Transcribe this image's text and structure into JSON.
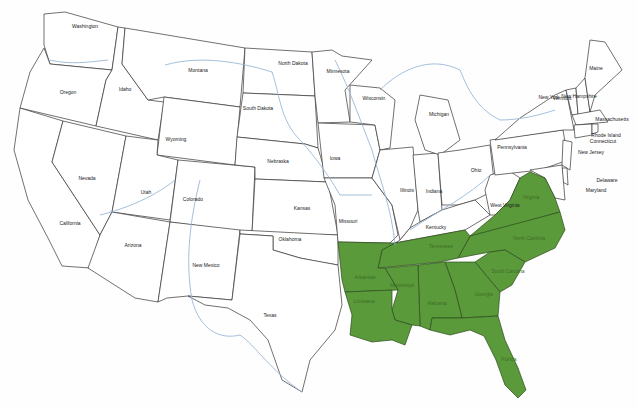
{
  "map": {
    "title": "United States state outline map",
    "highlight_color": "#5a9a3a",
    "outline_color": "#333333",
    "river_color": "#9ab8d8",
    "highlighted_states": [
      "Virginia",
      "North Carolina",
      "South Carolina",
      "Georgia",
      "Florida",
      "Alabama",
      "Mississippi",
      "Tennessee",
      "Arkansas",
      "Louisiana"
    ],
    "labels": [
      {
        "name": "Washington",
        "x": 85,
        "y": 26
      },
      {
        "name": "Oregon",
        "x": 68,
        "y": 92
      },
      {
        "name": "California",
        "x": 70,
        "y": 223
      },
      {
        "name": "Nevada",
        "x": 87,
        "y": 178
      },
      {
        "name": "Idaho",
        "x": 125,
        "y": 89
      },
      {
        "name": "Montana",
        "x": 198,
        "y": 70
      },
      {
        "name": "Wyoming",
        "x": 176,
        "y": 139
      },
      {
        "name": "Utah",
        "x": 146,
        "y": 192
      },
      {
        "name": "Colorado",
        "x": 193,
        "y": 199
      },
      {
        "name": "Arizona",
        "x": 133,
        "y": 245
      },
      {
        "name": "New Mexico",
        "x": 206,
        "y": 265
      },
      {
        "name": "North Dakota",
        "x": 293,
        "y": 63
      },
      {
        "name": "South Dakota",
        "x": 258,
        "y": 108
      },
      {
        "name": "Nebraska",
        "x": 278,
        "y": 161
      },
      {
        "name": "Kansas",
        "x": 302,
        "y": 208
      },
      {
        "name": "Oklahoma",
        "x": 290,
        "y": 239
      },
      {
        "name": "Texas",
        "x": 270,
        "y": 315
      },
      {
        "name": "Minnesota",
        "x": 338,
        "y": 71
      },
      {
        "name": "Iowa",
        "x": 335,
        "y": 158
      },
      {
        "name": "Missouri",
        "x": 348,
        "y": 221
      },
      {
        "name": "Wisconsin",
        "x": 374,
        "y": 98
      },
      {
        "name": "Illinois",
        "x": 407,
        "y": 190
      },
      {
        "name": "Michigan",
        "x": 439,
        "y": 114
      },
      {
        "name": "Indiana",
        "x": 434,
        "y": 191
      },
      {
        "name": "Ohio",
        "x": 476,
        "y": 170
      },
      {
        "name": "Kentucky",
        "x": 436,
        "y": 227
      },
      {
        "name": "West Virginia",
        "x": 505,
        "y": 205
      },
      {
        "name": "Pennsylvania",
        "x": 512,
        "y": 147
      },
      {
        "name": "New York",
        "x": 549,
        "y": 97
      },
      {
        "name": "Vermont",
        "x": 562,
        "y": 98
      },
      {
        "name": "New Hampshire",
        "x": 579,
        "y": 96
      },
      {
        "name": "Maine",
        "x": 596,
        "y": 68
      },
      {
        "name": "Massachusetts",
        "x": 612,
        "y": 119
      },
      {
        "name": "Rhode Island",
        "x": 606,
        "y": 135
      },
      {
        "name": "Connecticut",
        "x": 603,
        "y": 141
      },
      {
        "name": "New Jersey",
        "x": 591,
        "y": 152
      },
      {
        "name": "Delaware",
        "x": 607,
        "y": 180
      },
      {
        "name": "Maryland",
        "x": 596,
        "y": 190
      },
      {
        "name": "Virginia",
        "x": 531,
        "y": 197
      },
      {
        "name": "North Carolina",
        "x": 529,
        "y": 238
      },
      {
        "name": "South Carolina",
        "x": 508,
        "y": 271
      },
      {
        "name": "Georgia",
        "x": 484,
        "y": 294
      },
      {
        "name": "Florida",
        "x": 509,
        "y": 359
      },
      {
        "name": "Alabama",
        "x": 437,
        "y": 303
      },
      {
        "name": "Mississippi",
        "x": 402,
        "y": 285
      },
      {
        "name": "Tennessee",
        "x": 441,
        "y": 246
      },
      {
        "name": "Arkansas",
        "x": 365,
        "y": 277
      },
      {
        "name": "Louisiana",
        "x": 364,
        "y": 301
      }
    ]
  }
}
